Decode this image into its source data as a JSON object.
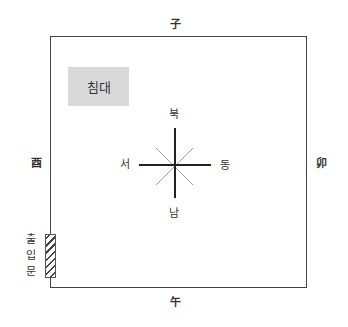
{
  "diagram": {
    "zodiac_labels": {
      "north": "子",
      "south": "午",
      "west": "酉",
      "east": "卯"
    },
    "compass_labels": {
      "north": "북",
      "south": "남",
      "west": "서",
      "east": "동"
    },
    "furniture": [
      {
        "name": "bed",
        "label": "침대",
        "color": "#d9d9d9"
      }
    ],
    "door": {
      "label_chars": [
        "출",
        "입",
        "문"
      ]
    }
  }
}
